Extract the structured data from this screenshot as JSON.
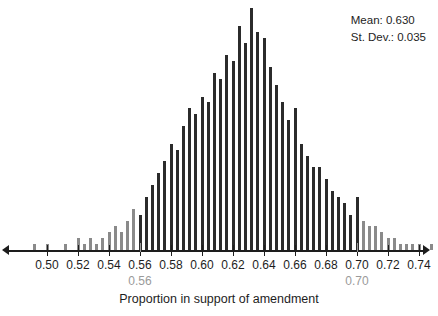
{
  "legend": {
    "mean_label": "Mean: 0.630",
    "stdev_label": "St. Dev.: 0.035"
  },
  "axis": {
    "title": "Proportion in support of amendment",
    "tick_labels": [
      "0.50",
      "0.52",
      "0.54",
      "0.56",
      "0.58",
      "0.60",
      "0.62",
      "0.64",
      "0.66",
      "0.68",
      "0.70",
      "0.72",
      "0.74"
    ],
    "tick_values": [
      0.5,
      0.52,
      0.54,
      0.56,
      0.58,
      0.6,
      0.62,
      0.64,
      0.66,
      0.68,
      0.7,
      0.72,
      0.74
    ]
  },
  "reference_marks": [
    {
      "label": "0.56",
      "value": 0.56
    },
    {
      "label": "0.70",
      "value": 0.7
    }
  ],
  "colors": {
    "bar_center": "#2b2b2b",
    "bar_tail": "#8a8a8a",
    "axis": "#1d1d1d",
    "reference": "#9a9a9a",
    "background": "#ffffff"
  },
  "chart_data": {
    "type": "bar",
    "title": "",
    "xlabel": "Proportion in support of amendment",
    "ylabel": "",
    "xlim": [
      0.487,
      0.755
    ],
    "ylim": [
      0,
      42
    ],
    "grid": false,
    "legend_position": "top-right",
    "annotations": [
      "Mean: 0.630",
      "St. Dev.: 0.035",
      "0.56",
      "0.70"
    ],
    "bin_width": 0.004,
    "tail_cutoffs": {
      "lower": 0.56,
      "upper": 0.7
    },
    "x": [
      0.492,
      0.496,
      0.5,
      0.504,
      0.508,
      0.512,
      0.516,
      0.52,
      0.524,
      0.528,
      0.532,
      0.536,
      0.54,
      0.544,
      0.548,
      0.552,
      0.556,
      0.56,
      0.564,
      0.568,
      0.572,
      0.576,
      0.58,
      0.584,
      0.588,
      0.592,
      0.596,
      0.6,
      0.604,
      0.608,
      0.612,
      0.616,
      0.62,
      0.624,
      0.628,
      0.632,
      0.636,
      0.64,
      0.644,
      0.648,
      0.652,
      0.656,
      0.66,
      0.664,
      0.668,
      0.672,
      0.676,
      0.68,
      0.684,
      0.688,
      0.692,
      0.696,
      0.7,
      0.704,
      0.708,
      0.712,
      0.716,
      0.72,
      0.724,
      0.728,
      0.732,
      0.736,
      0.74,
      0.744,
      0.748
    ],
    "values": [
      1,
      0,
      1,
      0,
      0,
      1,
      0,
      2,
      1,
      2,
      1,
      2,
      3,
      4,
      3,
      5,
      7,
      6,
      9,
      11,
      13,
      15,
      18,
      17,
      21,
      24,
      23,
      26,
      25,
      30,
      29,
      33,
      32,
      38,
      35,
      41,
      37,
      36,
      31,
      28,
      25,
      22,
      24,
      18,
      16,
      14,
      14,
      12,
      10,
      9,
      8,
      6,
      9,
      5,
      4,
      4,
      3,
      2,
      2,
      1,
      1,
      1,
      1,
      0,
      1
    ],
    "series": [
      {
        "name": "lower tail (< 0.56)",
        "color": "#8a8a8a"
      },
      {
        "name": "center (0.56 - 0.70)",
        "color": "#2b2b2b"
      },
      {
        "name": "upper tail (> 0.70)",
        "color": "#8a8a8a"
      }
    ]
  }
}
